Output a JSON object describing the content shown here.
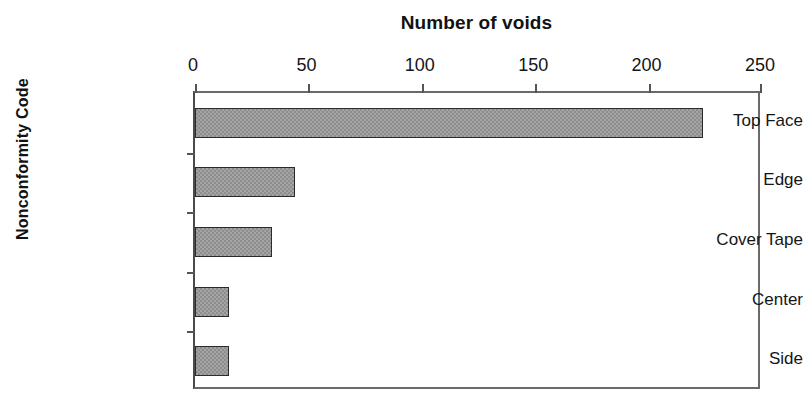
{
  "chart_data": {
    "type": "bar",
    "orientation": "horizontal",
    "title": "Number of voids",
    "xlabel": "Number of voids",
    "ylabel": "Nonconformity Code",
    "categories": [
      "Top Face",
      "Edge",
      "Cover Tape",
      "Center",
      "Side"
    ],
    "values": [
      224,
      44,
      34,
      15,
      15
    ],
    "xlim": [
      0,
      250
    ],
    "x_ticks": [
      0,
      50,
      100,
      150,
      200,
      250
    ],
    "x_tick_labels": [
      "0",
      "50",
      "100",
      "150",
      "200",
      "250"
    ],
    "grid": false,
    "legend": null,
    "bar_fill_color": "#8d8d8d",
    "bar_border_color": "#2b2b2b",
    "axis_color": "#555555",
    "background_color": "#ffffff"
  }
}
